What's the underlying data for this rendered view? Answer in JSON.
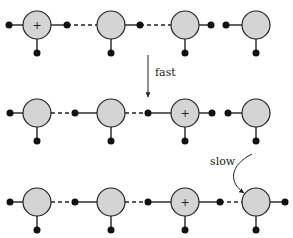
{
  "diagram": {
    "rows": [
      {
        "y": 25,
        "charged_index": 0,
        "bonds": [
          "solid",
          "dashed",
          "gap",
          "solid"
        ]
      },
      {
        "y": 113,
        "charged_index": 2,
        "bonds": [
          "dashed",
          "dashed",
          "gap"
        ]
      },
      {
        "y": 202,
        "charged_index": 2,
        "bonds": [
          "dashed",
          "dashed",
          "dashed"
        ]
      }
    ],
    "circle_x": [
      37,
      111,
      185,
      256
    ],
    "charge_symbol": "+",
    "labels": {
      "fast": "fast",
      "slow": "slow"
    },
    "colors": {
      "circle_fill": "#d4d4d4",
      "stroke": "#222222"
    }
  }
}
